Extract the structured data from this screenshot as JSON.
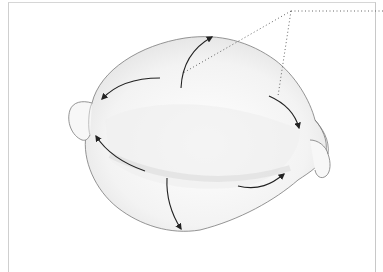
{
  "figure": {
    "colors": {
      "outline": "#6e6e6e",
      "shading": "#d9d9d9",
      "arrow": "#222222",
      "leader": "#555555",
      "frame": "#cfcfcf"
    },
    "arrows": [
      {
        "name": "arrow-up-top",
        "from": [
          181,
          88
        ],
        "to": [
          212,
          37
        ]
      },
      {
        "name": "arrow-left-upper",
        "from": [
          160,
          78
        ],
        "to": [
          102,
          99
        ]
      },
      {
        "name": "arrow-right-upper",
        "from": [
          269,
          96
        ],
        "to": [
          299,
          128
        ]
      },
      {
        "name": "arrow-left-lower",
        "from": [
          145,
          171
        ],
        "to": [
          96,
          136
        ]
      },
      {
        "name": "arrow-right-lower",
        "from": [
          238,
          186
        ],
        "to": [
          284,
          174
        ]
      },
      {
        "name": "arrow-down-bottom",
        "from": [
          167,
          178
        ],
        "to": [
          181,
          229
        ]
      }
    ],
    "leader_lines": {
      "apex": [
        291,
        11
      ],
      "to_right_edge": [
        383,
        11
      ],
      "to_arrow_top": [
        183,
        73
      ],
      "to_arrow_right": [
        278,
        96
      ]
    }
  }
}
